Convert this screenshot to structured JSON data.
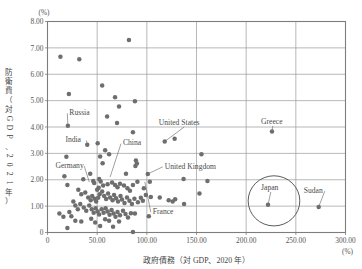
{
  "figure": {
    "background": "#ffffff",
    "dot_color": "#6e6e6e",
    "grid_color": "#9a9a9a",
    "frame_color": "#7d7d7d",
    "text_color": "#4a4a4a"
  },
  "axes": {
    "y_unit": "(%)",
    "x_unit": "(%)",
    "x_title": "政府債務（対 GDP、2020 年）",
    "y_title_chars": [
      "防",
      "衛",
      "費",
      "（",
      "対",
      "G",
      "D",
      "P",
      "、",
      "2",
      "0",
      "2",
      "1",
      "年",
      "）"
    ],
    "y_ticks": [
      "8.00",
      "7.00",
      "6.00",
      "5.00",
      "4.00",
      "3.00",
      "2.00",
      "1.00",
      "0"
    ],
    "x_ticks": [
      "0",
      "50.00",
      "100.00",
      "150.00",
      "200.00",
      "250.00",
      "300.00"
    ]
  },
  "chart_data": {
    "type": "scatter",
    "title": "",
    "xlabel": "政府債務（対 GDP、2020 年）",
    "ylabel": "防衛費（対GDP、2021年）",
    "xlim": [
      0,
      300
    ],
    "ylim": [
      0,
      8
    ],
    "x_unit": "(%)",
    "y_unit": "(%)",
    "grid": true,
    "x_gridlines": [
      0,
      50,
      100,
      150,
      200,
      250,
      300
    ],
    "y_gridlines": [
      0,
      1,
      2,
      3,
      4,
      5,
      6,
      7,
      8
    ],
    "legend": "none",
    "series": [
      {
        "name": "Countries",
        "color": "#6e6e6e",
        "points": [
          [
            13.0,
            6.66
          ],
          [
            32.0,
            6.57
          ],
          [
            82.0,
            7.3
          ],
          [
            55.0,
            5.57
          ],
          [
            21.5,
            5.25
          ],
          [
            68.0,
            5.13
          ],
          [
            88.0,
            4.98
          ],
          [
            72.0,
            4.78
          ],
          [
            60.0,
            4.4
          ],
          [
            70.0,
            4.15
          ],
          [
            86.0,
            3.8
          ],
          [
            20.5,
            4.05
          ],
          [
            226.0,
            3.83
          ],
          [
            128.0,
            3.55
          ],
          [
            118.0,
            3.45
          ],
          [
            155.0,
            2.97
          ],
          [
            19.0,
            2.87
          ],
          [
            40.0,
            3.33
          ],
          [
            50.5,
            3.38
          ],
          [
            58.0,
            3.12
          ],
          [
            62.0,
            2.97
          ],
          [
            89.0,
            2.73
          ],
          [
            90.0,
            2.62
          ],
          [
            53.0,
            2.88
          ],
          [
            55.5,
            2.63
          ],
          [
            88.5,
            2.52
          ],
          [
            101.0,
            2.22
          ],
          [
            137.0,
            2.03
          ],
          [
            161.0,
            1.95
          ],
          [
            17.0,
            2.13
          ],
          [
            20.0,
            1.8
          ],
          [
            36.0,
            2.02
          ],
          [
            43.0,
            2.23
          ],
          [
            46.0,
            1.95
          ],
          [
            47.0,
            1.88
          ],
          [
            52.0,
            2.03
          ],
          [
            53.5,
            1.93
          ],
          [
            56.0,
            1.78
          ],
          [
            60.5,
            1.83
          ],
          [
            65.0,
            1.9
          ],
          [
            68.0,
            1.8
          ],
          [
            70.5,
            1.72
          ],
          [
            73.0,
            1.85
          ],
          [
            77.0,
            1.78
          ],
          [
            80.5,
            1.68
          ],
          [
            83.0,
            1.58
          ],
          [
            86.0,
            1.8
          ],
          [
            79.0,
            2.23
          ],
          [
            90.5,
            1.92
          ],
          [
            97.0,
            1.68
          ],
          [
            103.0,
            1.92
          ],
          [
            104.0,
            1.35
          ],
          [
            113.0,
            1.33
          ],
          [
            122.0,
            1.22
          ],
          [
            126.0,
            1.18
          ],
          [
            128.5,
            1.26
          ],
          [
            137.5,
            1.08
          ],
          [
            153.0,
            1.48
          ],
          [
            222.0,
            1.05
          ],
          [
            273.0,
            0.97
          ],
          [
            31.0,
            1.62
          ],
          [
            34.0,
            1.45
          ],
          [
            38.0,
            1.52
          ],
          [
            41.0,
            1.33
          ],
          [
            43.5,
            1.22
          ],
          [
            45.0,
            1.38
          ],
          [
            47.5,
            1.28
          ],
          [
            49.0,
            1.18
          ],
          [
            51.0,
            1.32
          ],
          [
            52.5,
            1.45
          ],
          [
            55.0,
            1.55
          ],
          [
            57.0,
            1.38
          ],
          [
            59.0,
            1.27
          ],
          [
            61.0,
            1.48
          ],
          [
            63.0,
            1.33
          ],
          [
            65.5,
            1.22
          ],
          [
            67.0,
            1.42
          ],
          [
            69.0,
            1.3
          ],
          [
            71.0,
            1.18
          ],
          [
            73.5,
            1.38
          ],
          [
            75.0,
            1.25
          ],
          [
            77.5,
            1.12
          ],
          [
            80.0,
            1.33
          ],
          [
            82.5,
            1.2
          ],
          [
            85.0,
            1.08
          ],
          [
            87.5,
            1.28
          ],
          [
            91.0,
            1.15
          ],
          [
            94.0,
            1.32
          ],
          [
            96.0,
            1.2
          ],
          [
            99.0,
            1.42
          ],
          [
            102.0,
            0.62
          ],
          [
            26.0,
            1.18
          ],
          [
            28.0,
            1.02
          ],
          [
            30.5,
            0.88
          ],
          [
            33.0,
            1.08
          ],
          [
            36.5,
            0.95
          ],
          [
            39.0,
            0.82
          ],
          [
            42.0,
            1.02
          ],
          [
            44.5,
            0.88
          ],
          [
            46.5,
            0.75
          ],
          [
            48.5,
            0.92
          ],
          [
            50.5,
            0.8
          ],
          [
            52.0,
            0.68
          ],
          [
            54.5,
            0.88
          ],
          [
            56.5,
            0.75
          ],
          [
            58.5,
            0.92
          ],
          [
            60.5,
            0.8
          ],
          [
            62.5,
            0.67
          ],
          [
            64.5,
            0.85
          ],
          [
            66.5,
            0.72
          ],
          [
            68.5,
            0.6
          ],
          [
            70.5,
            0.78
          ],
          [
            73.0,
            0.65
          ],
          [
            76.0,
            0.82
          ],
          [
            78.5,
            0.7
          ],
          [
            81.0,
            0.57
          ],
          [
            84.0,
            0.73
          ],
          [
            88.0,
            0.72
          ],
          [
            12.0,
            0.72
          ],
          [
            16.0,
            0.6
          ],
          [
            20.0,
            0.17
          ],
          [
            28.0,
            0.45
          ],
          [
            34.0,
            0.42
          ],
          [
            44.0,
            0.52
          ],
          [
            48.0,
            0.38
          ],
          [
            53.0,
            0.25
          ],
          [
            58.0,
            0.5
          ],
          [
            62.0,
            0.45
          ],
          [
            66.0,
            0.22
          ],
          [
            72.0,
            0.42
          ],
          [
            86.0,
            0.02
          ],
          [
            22.0,
            0.78
          ],
          [
            24.0,
            0.62
          ],
          [
            50.0,
            1.62
          ],
          [
            51.5,
            1.7
          ]
        ]
      }
    ],
    "annotations": [
      {
        "label": "Russia",
        "label_x": 22,
        "label_y": 4.45,
        "point_x": 20.5,
        "point_y": 4.05
      },
      {
        "label": "India",
        "label_x": 18,
        "label_y": 3.42,
        "point_x": 40.0,
        "point_y": 3.33
      },
      {
        "label": "China",
        "label_x": 76,
        "label_y": 3.3,
        "point_x": 63.0,
        "point_y": 2.1
      },
      {
        "label": "United States",
        "label_x": 112,
        "label_y": 4.08,
        "point_x": 118.0,
        "point_y": 3.45
      },
      {
        "label": "Greece",
        "label_x": 215,
        "label_y": 4.12,
        "point_x": 226.0,
        "point_y": 3.83
      },
      {
        "label": "Germany",
        "label_x": 8,
        "label_y": 2.45,
        "point_x": 42.0,
        "point_y": 1.92
      },
      {
        "label": "United Kingdom",
        "label_x": 118,
        "label_y": 2.42,
        "point_x": 101.0,
        "point_y": 2.22
      },
      {
        "label": "France",
        "label_x": 106,
        "label_y": 0.7,
        "point_x": 98.0,
        "point_y": 1.92
      },
      {
        "label": "Japan",
        "label_x": 215,
        "label_y": 1.62,
        "point_x": 222.0,
        "point_y": 1.05
      },
      {
        "label": "Sudan",
        "label_x": 258,
        "label_y": 1.5,
        "point_x": 273.0,
        "point_y": 0.97
      }
    ],
    "highlight_circle": {
      "label": "Japan",
      "center_x": 228,
      "center_y": 1.2,
      "radius_x": 26,
      "radius_y": 0.95
    }
  }
}
